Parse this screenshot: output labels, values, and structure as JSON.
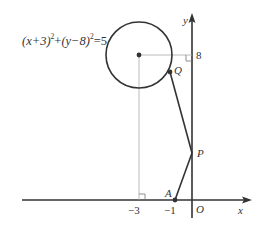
{
  "equation": {
    "lhs_a": "(x+3)",
    "exp_a": "2",
    "plus": "+",
    "lhs_b": "(y−8)",
    "exp_b": "2",
    "rhs": "=5"
  },
  "axes": {
    "x_label": "x",
    "y_label": "y",
    "origin_label": "O"
  },
  "ticks": {
    "x_minus3": "−3",
    "x_minus1": "−1",
    "y_8": "8"
  },
  "points": {
    "Q": "Q",
    "P": "P",
    "A": "A"
  },
  "diagram": {
    "circle_center": [
      -3,
      8
    ],
    "circle_radius_squared": 5,
    "point_A": [
      -1,
      0
    ],
    "P_on_y_axis": true,
    "Q_on_circle": true
  },
  "colors": {
    "stroke": "#333333",
    "guide": "#999999"
  }
}
